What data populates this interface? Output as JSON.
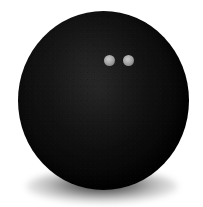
{
  "scene": {
    "subject": "black squash ball",
    "caption": "Black rubber squash ball with two grey dots on a plain white background",
    "background_color": "#ffffff",
    "width": 203,
    "height": 207
  },
  "ball": {
    "label": "squash-ball",
    "body_color": "#0b0b0b",
    "highlight_color": "#1a1a1a",
    "center_x": 103,
    "center_y": 100,
    "width": 171,
    "height": 179,
    "material": "matte rubber"
  },
  "dots": [
    {
      "label": "left-dot",
      "color": "#a6a6a6",
      "center_x": 91,
      "center_y": 49,
      "diameter": 11
    },
    {
      "label": "right-dot",
      "color": "#a6a6a6",
      "center_x": 110,
      "center_y": 49,
      "diameter": 11
    }
  ],
  "shadow": {
    "label": "contact-shadow",
    "color": "#000000",
    "center_x": 102,
    "center_y": 186,
    "width": 152,
    "height": 33
  }
}
